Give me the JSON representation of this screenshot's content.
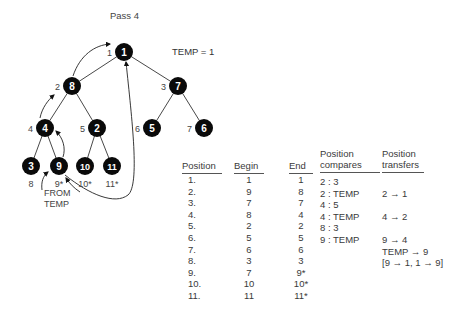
{
  "title": "Pass 4",
  "temp_label": "TEMP = 1",
  "from_temp_label": [
    "FROM",
    "TEMP"
  ],
  "tree": {
    "nodes": [
      {
        "position": 1,
        "value": "1",
        "pos_label": "1",
        "x": 124,
        "y": 52
      },
      {
        "position": 2,
        "value": "8",
        "pos_label": "2",
        "x": 72,
        "y": 86
      },
      {
        "position": 3,
        "value": "7",
        "pos_label": "3",
        "x": 178,
        "y": 86
      },
      {
        "position": 4,
        "value": "4",
        "pos_label": "4",
        "x": 45,
        "y": 128
      },
      {
        "position": 5,
        "value": "2",
        "pos_label": "5",
        "x": 97,
        "y": 128
      },
      {
        "position": 6,
        "value": "5",
        "pos_label": "6",
        "x": 152,
        "y": 128
      },
      {
        "position": 7,
        "value": "6",
        "pos_label": "7",
        "x": 204,
        "y": 128
      },
      {
        "position": 8,
        "value": "3",
        "pos_label": "8",
        "x": 31,
        "y": 166
      },
      {
        "position": 9,
        "value": "9",
        "pos_label": "9*",
        "x": 59,
        "y": 166
      },
      {
        "position": 10,
        "value": "10",
        "pos_label": "10*",
        "x": 85,
        "y": 166
      },
      {
        "position": 11,
        "value": "11",
        "pos_label": "11*",
        "x": 112,
        "y": 166
      }
    ]
  },
  "table": {
    "headers": {
      "position": "Position",
      "begin": "Begin",
      "end": "End",
      "compares": [
        "Position",
        "compares"
      ],
      "transfers": [
        "Position",
        "transfers"
      ]
    },
    "position": [
      "1.",
      "2.",
      "3.",
      "4.",
      "5.",
      "6.",
      "7.",
      "8.",
      "9.",
      "10.",
      "11."
    ],
    "begin": [
      "1",
      "9",
      "7",
      "8",
      "2",
      "5",
      "6",
      "3",
      "7",
      "10",
      "11"
    ],
    "end": [
      "1",
      "8",
      "7",
      "4",
      "2",
      "5",
      "6",
      "3",
      "9*",
      "10*",
      "11*"
    ],
    "compares": [
      "2 : 3",
      "2 : TEMP",
      "4 : 5",
      "4 : TEMP",
      "8 : 3",
      "9 : TEMP"
    ],
    "transfers": [
      "",
      "2 → 1",
      "",
      "4 → 2",
      "",
      "9 → 4",
      "TEMP → 9",
      "[9 → 1,  1 → 9]"
    ]
  }
}
